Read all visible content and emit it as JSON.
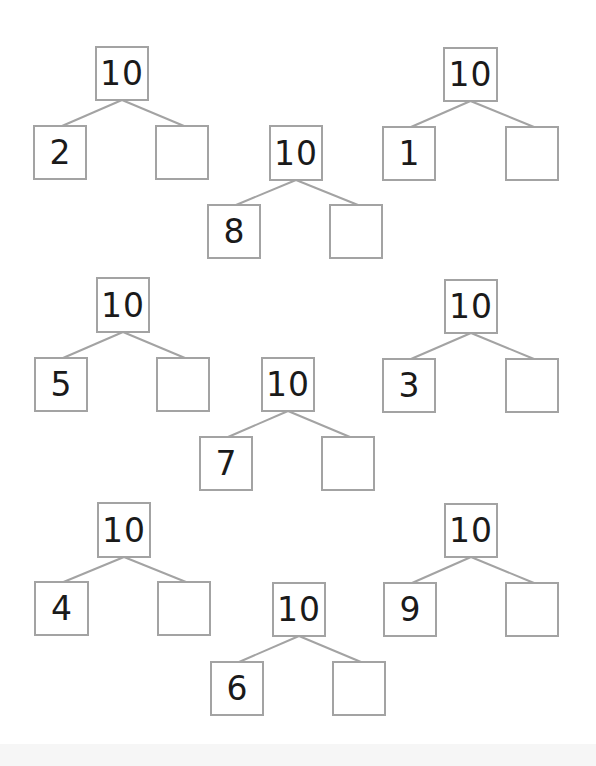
{
  "worksheet": {
    "topic": "Number bonds to 10",
    "line_color": "#a3a3a3",
    "box_border_color": "#a3a3a3",
    "text_color": "#1a1a1a",
    "bonds": [
      {
        "whole": "10",
        "part_known": "2",
        "part_missing": "",
        "whole_box": [
          95,
          46,
          54,
          55
        ],
        "left_box": [
          33,
          125,
          54,
          55
        ],
        "right_box": [
          155,
          125,
          54,
          55
        ]
      },
      {
        "whole": "10",
        "part_known": "1",
        "part_missing": "",
        "whole_box": [
          443,
          47,
          55,
          55
        ],
        "left_box": [
          382,
          126,
          54,
          55
        ],
        "right_box": [
          505,
          126,
          54,
          55
        ]
      },
      {
        "whole": "10",
        "part_known": "8",
        "part_missing": "",
        "whole_box": [
          269,
          125,
          54,
          56
        ],
        "left_box": [
          207,
          204,
          54,
          55
        ],
        "right_box": [
          329,
          204,
          54,
          55
        ]
      },
      {
        "whole": "10",
        "part_known": "5",
        "part_missing": "",
        "whole_box": [
          96,
          277,
          54,
          56
        ],
        "left_box": [
          34,
          357,
          54,
          55
        ],
        "right_box": [
          156,
          357,
          54,
          55
        ]
      },
      {
        "whole": "10",
        "part_known": "3",
        "part_missing": "",
        "whole_box": [
          444,
          279,
          54,
          55
        ],
        "left_box": [
          382,
          358,
          54,
          55
        ],
        "right_box": [
          505,
          358,
          54,
          55
        ]
      },
      {
        "whole": "10",
        "part_known": "7",
        "part_missing": "",
        "whole_box": [
          261,
          357,
          54,
          55
        ],
        "left_box": [
          199,
          436,
          54,
          55
        ],
        "right_box": [
          321,
          436,
          54,
          55
        ]
      },
      {
        "whole": "10",
        "part_known": "4",
        "part_missing": "",
        "whole_box": [
          97,
          502,
          54,
          56
        ],
        "left_box": [
          34,
          581,
          55,
          55
        ],
        "right_box": [
          157,
          581,
          54,
          55
        ]
      },
      {
        "whole": "10",
        "part_known": "9",
        "part_missing": "",
        "whole_box": [
          444,
          503,
          54,
          55
        ],
        "left_box": [
          383,
          582,
          54,
          55
        ],
        "right_box": [
          505,
          582,
          54,
          55
        ]
      },
      {
        "whole": "10",
        "part_known": "6",
        "part_missing": "",
        "whole_box": [
          272,
          582,
          54,
          55
        ],
        "left_box": [
          210,
          661,
          54,
          55
        ],
        "right_box": [
          332,
          661,
          54,
          55
        ]
      }
    ]
  }
}
